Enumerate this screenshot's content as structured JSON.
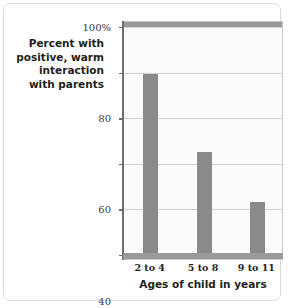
{
  "caption": {
    "lines": [
      "Percent with",
      "positive, warm",
      "interaction",
      "with parents"
    ]
  },
  "chart_data": {
    "type": "bar",
    "title": "",
    "subtitle": "",
    "categories": [
      "2 to 4",
      "5 to 8",
      "9 to 11"
    ],
    "values": [
      81,
      47,
      25
    ],
    "series": [
      {
        "name": "Percent with positive, warm interaction with parents",
        "values": [
          81,
          47,
          25
        ]
      }
    ],
    "xlabel": "Ages of child in years",
    "ylabel": "Percent with positive, warm interaction with parents",
    "ylim": [
      0,
      100
    ],
    "yticks": [
      0,
      20,
      40,
      60,
      80,
      100
    ],
    "ytick_labels": [
      "0",
      "20",
      "40",
      "60",
      "80",
      "100%"
    ],
    "grid": true,
    "legend": "none",
    "bar_color": "#8a8a8a",
    "plot_background": "#fbfbfb",
    "gridline_color": "#d2d2d2",
    "axis_color": "#6d6d6d"
  }
}
